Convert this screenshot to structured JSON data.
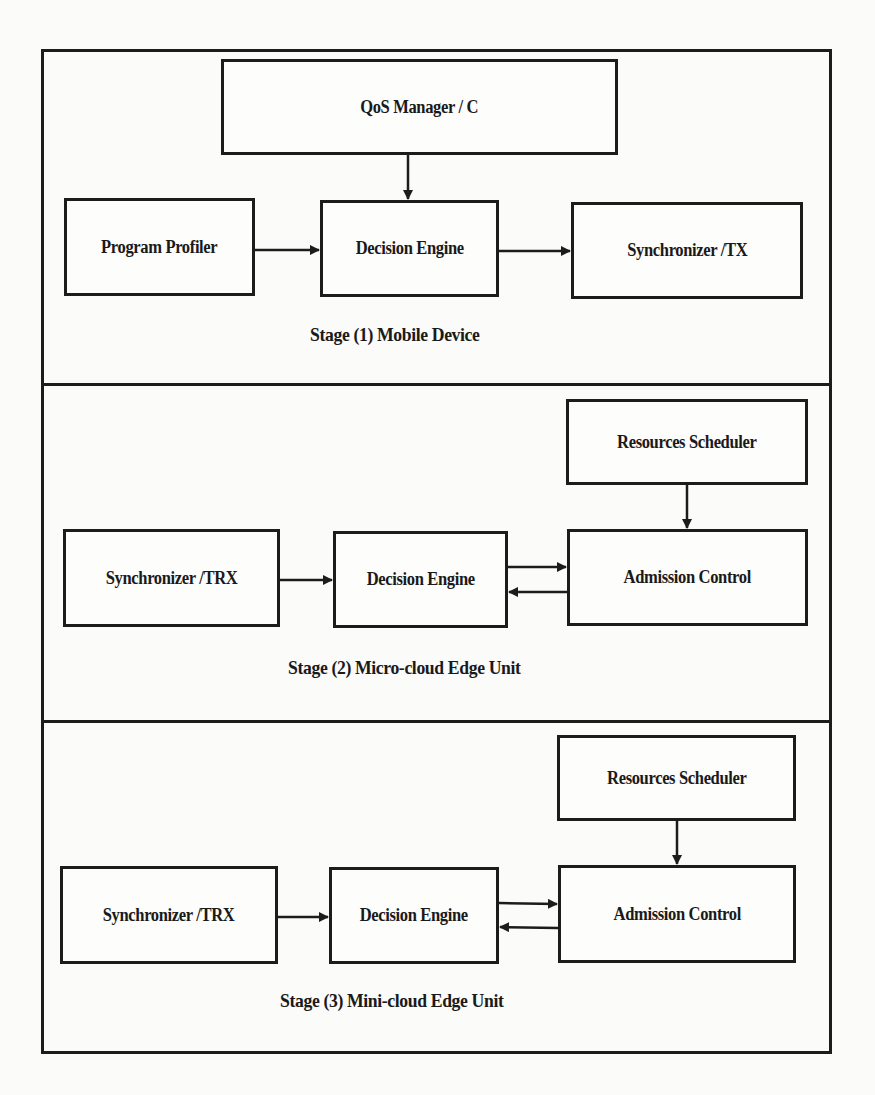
{
  "diagram": {
    "type": "block-diagram",
    "stages": [
      {
        "id": "stage1",
        "label": "Stage (1) Mobile Device",
        "blocks": {
          "qos_manager": "QoS Manager / C",
          "program_profiler": "Program Profiler",
          "decision_engine": "Decision Engine",
          "synchronizer": "Synchronizer /TX"
        },
        "flows": [
          {
            "from": "QoS Manager / C",
            "to": "Decision Engine"
          },
          {
            "from": "Program Profiler",
            "to": "Decision Engine"
          },
          {
            "from": "Decision Engine",
            "to": "Synchronizer /TX"
          }
        ]
      },
      {
        "id": "stage2",
        "label": "Stage (2) Micro-cloud Edge Unit",
        "blocks": {
          "resources_scheduler": "Resources Scheduler",
          "synchronizer": "Synchronizer /TRX",
          "decision_engine": "Decision Engine",
          "admission_control": "Admission Control"
        },
        "flows": [
          {
            "from": "Resources Scheduler",
            "to": "Admission Control"
          },
          {
            "from": "Synchronizer /TRX",
            "to": "Decision Engine"
          },
          {
            "from": "Decision Engine",
            "to": "Admission Control"
          },
          {
            "from": "Admission Control",
            "to": "Decision Engine"
          }
        ]
      },
      {
        "id": "stage3",
        "label": "Stage (3) Mini-cloud Edge Unit",
        "blocks": {
          "resources_scheduler": "Resources Scheduler",
          "synchronizer": "Synchronizer /TRX",
          "decision_engine": "Decision Engine",
          "admission_control": "Admission Control"
        },
        "flows": [
          {
            "from": "Resources Scheduler",
            "to": "Admission Control"
          },
          {
            "from": "Synchronizer /TRX",
            "to": "Decision Engine"
          },
          {
            "from": "Decision Engine",
            "to": "Admission Control"
          },
          {
            "from": "Admission Control",
            "to": "Decision Engine"
          }
        ]
      }
    ],
    "colors": {
      "line": "#1c1c1c",
      "background": "#fbfbfa"
    }
  }
}
